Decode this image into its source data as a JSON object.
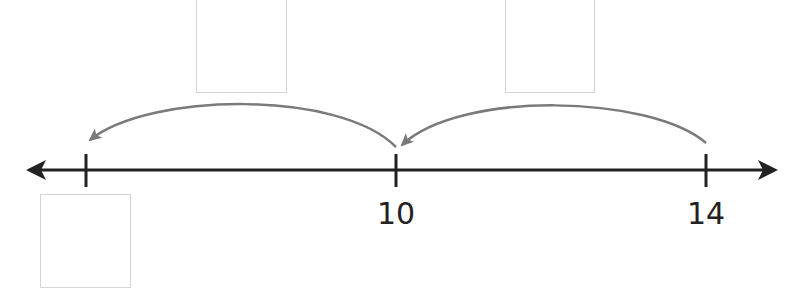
{
  "diagram": {
    "type": "number-line-with-jumps",
    "line_color": "#222222",
    "jump_arrow_color": "#7a7a7a",
    "box_border_color": "#d4d4d4",
    "ticks": [
      {
        "value": null,
        "label": ""
      },
      {
        "value": 10,
        "label": "10"
      },
      {
        "value": 14,
        "label": "14"
      }
    ],
    "jumps": [
      {
        "from": 14,
        "to": 10
      },
      {
        "from": 10,
        "to": null
      }
    ],
    "answer_boxes": [
      {
        "role": "jump-size-first",
        "value": ""
      },
      {
        "role": "jump-size-second",
        "value": ""
      },
      {
        "role": "end-point-value",
        "value": ""
      }
    ]
  }
}
